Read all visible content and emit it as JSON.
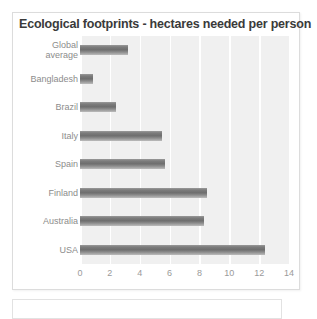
{
  "chart_data": {
    "type": "bar",
    "orientation": "horizontal",
    "title": "Ecological footprints - hectares needed per person",
    "xlabel": "",
    "ylabel": "",
    "categories": [
      "Global average",
      "Bangladesh",
      "Brazil",
      "Italy",
      "Spain",
      "Finland",
      "Australia",
      "USA"
    ],
    "values": [
      3.2,
      0.9,
      2.4,
      5.5,
      5.7,
      8.5,
      8.3,
      12.4
    ],
    "xlim": [
      0,
      14
    ],
    "xticks": [
      0,
      2,
      4,
      6,
      8,
      10,
      12,
      14
    ],
    "xtick_labels": [
      "0",
      "2",
      "4",
      "6",
      "8",
      "10",
      "12",
      "14"
    ],
    "grid": "vertical-only",
    "legend": "none",
    "colors": {
      "bar": "#6e6e6e",
      "plot_background": "#f0f0f0",
      "gridline": "#ffffff",
      "title_text": "#3a3a3a",
      "tick_text": "#9a9a9a",
      "category_text": "#8c8c8c",
      "panel_border": "#dcdcdc"
    }
  },
  "panel": {
    "title": "Ecological footprints - hectares needed per person"
  }
}
